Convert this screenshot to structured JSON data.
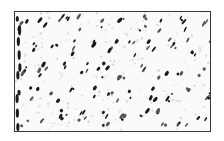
{
  "image": {
    "description": "Texture swatch with dark diagonal specks in a lattice pattern",
    "frame": {
      "border_color": "#3a3a3a",
      "fill_color": "#fafafa"
    },
    "colors": {
      "dark_speck": "#1a1a1a",
      "mid_speck": "#555555",
      "light_speck": "#cfcfcf"
    },
    "lattice": {
      "cols": 10,
      "rows": 5,
      "col_spacing": 20,
      "row_spacing": 24,
      "offset_x": 6,
      "offset_y": 4
    }
  }
}
